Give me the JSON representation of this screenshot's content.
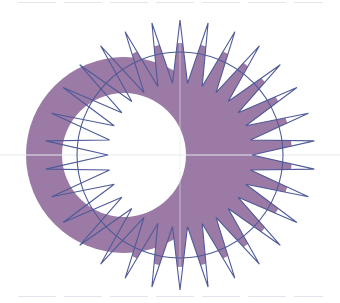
{
  "figure": {
    "colors": {
      "background": "#ffffff",
      "fill": "#9b7aa6",
      "stroke": "#4f5a98",
      "guide": "#e6e8f0"
    },
    "star": {
      "cx": 180,
      "cy": 155,
      "points": 30,
      "outer_r": 135,
      "inner_r": 72,
      "start_angle_deg": -90
    },
    "circle": {
      "cx": 180,
      "cy": 155,
      "r": 103
    },
    "fill_clip_circle": {
      "cx": 180,
      "cy": 155,
      "r": 112
    },
    "ring": {
      "cx": 124,
      "cy": 155,
      "outer_r": 98,
      "hole": {
        "cx": 124,
        "cy": 155,
        "r": 62
      }
    },
    "guides": {
      "h_y": 155,
      "v_x": 180
    }
  }
}
